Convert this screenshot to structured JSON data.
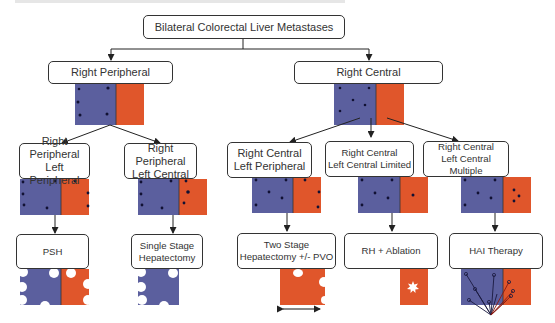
{
  "root": {
    "label": "Bilateral Colorectal Liver Metastases"
  },
  "level1": [
    {
      "label": "Right Peripheral"
    },
    {
      "label": "Right Central"
    }
  ],
  "level2": [
    {
      "line1": "Right Peripheral",
      "line2": "Left Peripheral"
    },
    {
      "line1": "Right Peripheral",
      "line2": "Left Central"
    },
    {
      "line1": "Right Central",
      "line2": "Left Peripheral"
    },
    {
      "line1": "Right Central",
      "line2": "Left Central Limited"
    },
    {
      "line1": "Right Central",
      "line2": "Left Central Multiple"
    }
  ],
  "treatments": [
    {
      "line1": "PSH",
      "line2": ""
    },
    {
      "line1": "Single Stage",
      "line2": "Hepatectomy"
    },
    {
      "line1": "Two Stage",
      "line2": "Hepatectomy +/- PVO"
    },
    {
      "line1": "RH + Ablation",
      "line2": ""
    },
    {
      "line1": "HAI Therapy",
      "line2": ""
    }
  ],
  "colors": {
    "right_lobe": "#5b5f9e",
    "left_lobe": "#e0562b",
    "lesion": "#111133",
    "line": "#222222"
  }
}
